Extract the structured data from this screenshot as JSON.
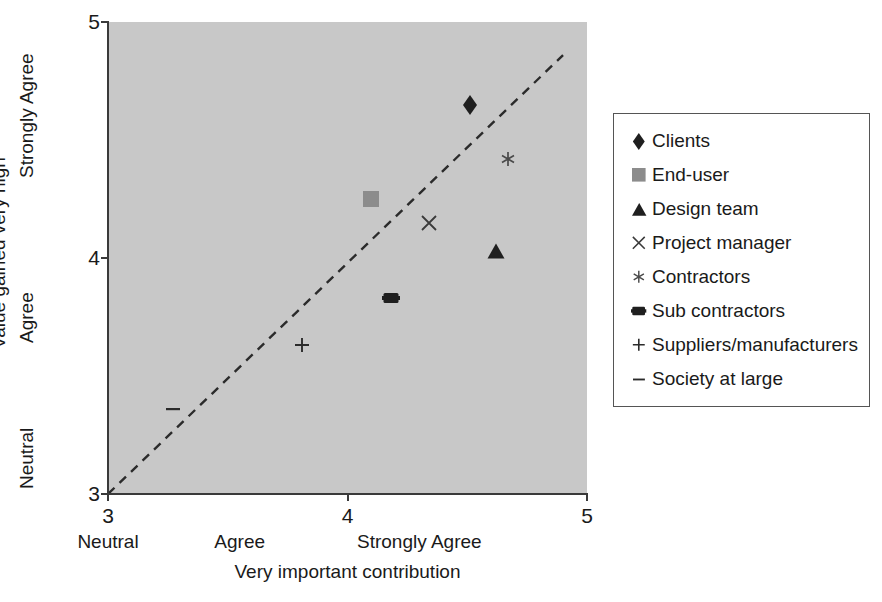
{
  "chart_data": {
    "type": "scatter",
    "title": "",
    "xlabel": "Very important contribution",
    "ylabel": "Value gained very high",
    "xlim": [
      3,
      5
    ],
    "ylim": [
      3,
      5
    ],
    "grid": false,
    "background_color": "#c8c8c8",
    "legend_position": "right",
    "x_ticks": [
      "3",
      "4",
      "5"
    ],
    "x_tick_values": [
      3,
      4,
      5
    ],
    "y_ticks": [
      "3",
      "4",
      "5"
    ],
    "y_tick_values": [
      3,
      4,
      5
    ],
    "x_category_labels": [
      {
        "label": "Neutral",
        "value": 3.0
      },
      {
        "label": "Agree",
        "value": 3.55
      },
      {
        "label": "Strongly Agree",
        "value": 4.3
      }
    ],
    "y_category_labels": [
      {
        "label": "Neutral",
        "value": 3.1
      },
      {
        "label": "Agree",
        "value": 3.72
      },
      {
        "label": "Strongly Agree",
        "value": 4.42
      }
    ],
    "reference_line": {
      "label": "y = x diagonal",
      "style": "dashed",
      "color": "#2b2b2b",
      "from": [
        3.0,
        3.0
      ],
      "to": [
        4.9,
        4.86
      ]
    },
    "points": [
      {
        "name": "Clients",
        "marker": "diamond",
        "color": "#1f1f1f",
        "x": 4.51,
        "y": 4.65
      },
      {
        "name": "End-user",
        "marker": "square",
        "color": "#8c8c8c",
        "x": 4.1,
        "y": 4.25
      },
      {
        "name": "Design team",
        "marker": "triangle",
        "color": "#1f1f1f",
        "x": 4.62,
        "y": 4.03
      },
      {
        "name": "Project manager",
        "marker": "cross-x",
        "color": "#3a3a3a",
        "x": 4.34,
        "y": 4.15
      },
      {
        "name": "Contractors",
        "marker": "asterisk",
        "color": "#4a4a4a",
        "x": 4.67,
        "y": 4.42
      },
      {
        "name": "Sub contractors",
        "marker": "hbar",
        "color": "#1f1f1f",
        "x": 4.18,
        "y": 3.83
      },
      {
        "name": "Suppliers/manufacturers",
        "marker": "plus",
        "color": "#2b2b2b",
        "x": 3.81,
        "y": 3.63
      },
      {
        "name": "Society at large",
        "marker": "dash",
        "color": "#2b2b2b",
        "x": 3.27,
        "y": 3.36
      }
    ]
  },
  "legend": {
    "items": [
      {
        "label": "Clients",
        "marker": "diamond",
        "color": "#1f1f1f"
      },
      {
        "label": "End-user",
        "marker": "square",
        "color": "#8c8c8c"
      },
      {
        "label": "Design team",
        "marker": "triangle",
        "color": "#1f1f1f"
      },
      {
        "label": "Project manager",
        "marker": "cross-x",
        "color": "#3a3a3a"
      },
      {
        "label": "Contractors",
        "marker": "asterisk",
        "color": "#4a4a4a"
      },
      {
        "label": "Sub contractors",
        "marker": "hbar",
        "color": "#1f1f1f"
      },
      {
        "label": "Suppliers/manufacturers",
        "marker": "plus",
        "color": "#2b2b2b"
      },
      {
        "label": "Society at large",
        "marker": "dash",
        "color": "#2b2b2b"
      }
    ]
  }
}
